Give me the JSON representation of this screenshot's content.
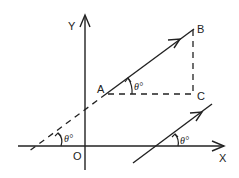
{
  "diagram": {
    "type": "geometry-vector-components",
    "axes": {
      "x_label": "X",
      "y_label": "Y",
      "origin_label": "O"
    },
    "points": {
      "A": "A",
      "B": "B",
      "C": "C"
    },
    "angle_labels": [
      "θ°",
      "θ°",
      "θ°"
    ],
    "elements": [
      {
        "id": "AB",
        "style": "solid-arrow",
        "from": "A",
        "to": "B"
      },
      {
        "id": "AC",
        "style": "dashed",
        "from": "A",
        "to": "C"
      },
      {
        "id": "BC",
        "style": "dashed",
        "from": "B",
        "to": "C"
      },
      {
        "id": "extension",
        "style": "dashed",
        "description": "extension of AB to X-axis"
      },
      {
        "id": "parallel",
        "style": "solid-arrow",
        "description": "parallel line crossing X-axis"
      }
    ],
    "colors": {
      "stroke": "#222222",
      "background": "#ffffff"
    }
  }
}
